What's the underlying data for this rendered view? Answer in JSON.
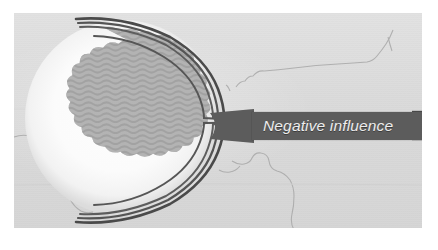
{
  "figure": {
    "kind": "scanned-grayscale-diagram",
    "label": {
      "text": "Negative influence",
      "style": "italic",
      "box_color": "#5c5c5c",
      "text_color": "#ededed"
    },
    "palette": {
      "page_background": "#ffffff",
      "plate_background": "#dcdcdc",
      "halo": "#f7f7f7",
      "blob_fill": "#8f8f8f",
      "blob_texture": "#7e7e7e",
      "line_dark": "#4f4f4f",
      "map_line": "#a9a9a9"
    },
    "elements": {
      "circle_name": "influence-circle",
      "halo_name": "circle-halo",
      "blob_name": "textured-blob",
      "blob_texture": "wavy-zigzag-hatch",
      "connector_name": "connector-line-bundle",
      "connector_count": 4,
      "connector_strands_per_bundle": 3,
      "map_lines_name": "background-map-borders",
      "right_ticks_name": "label-right-ticks",
      "right_ticks_count": 4
    }
  }
}
